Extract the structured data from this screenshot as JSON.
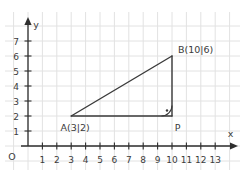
{
  "figure": {
    "canvas": {
      "width": 243,
      "height": 178,
      "background": "#ffffff"
    },
    "colors": {
      "grid": "#e2e2e2",
      "axis": "#2e2e2e",
      "shape": "#3a3a3a",
      "text": "#3b3b3b"
    },
    "origin": {
      "px": 28,
      "py": 146,
      "label": "O"
    },
    "x_axis": {
      "label": "x",
      "unit_px": 14.4,
      "line_start_px": 21,
      "arrow_tip_px": 238,
      "label_pos": {
        "x": 230.5,
        "y": 137
      },
      "tick_labels": [
        "1",
        "2",
        "3",
        "4",
        "5",
        "6",
        "7",
        "8",
        "9",
        "10",
        "11",
        "12",
        "13"
      ],
      "tick_label_baseline": 163
    },
    "y_axis": {
      "label": "y",
      "unit_px": 15,
      "arrow_tip_px": 17,
      "label_pos": {
        "x": 36,
        "y": 28
      },
      "tick_labels": [
        "1",
        "2",
        "3",
        "4",
        "5",
        "6",
        "7"
      ],
      "tick_label_right_x": 19
    },
    "origin_label_pos": {
      "x": 12,
      "y": 160
    },
    "grid_range": {
      "x_min": -1,
      "x_max": 14,
      "y_min": -1,
      "y_max": 8
    },
    "grid_extent": {
      "v_top": 12,
      "v_bottom": 170,
      "h_left": 5,
      "h_right": 240
    },
    "points": [
      {
        "id": "A",
        "x": 3,
        "y": 2,
        "label": "A(3|2)",
        "label_dx": 4,
        "label_dy": 15,
        "anchor": "middle"
      },
      {
        "id": "B",
        "x": 10,
        "y": 6,
        "label": "B(10|6)",
        "label_dx": 6,
        "label_dy": -3,
        "anchor": "start"
      },
      {
        "id": "P",
        "x": 10,
        "y": 2,
        "label": "P",
        "label_dx": 5.5,
        "label_dy": 14.5,
        "anchor": "middle"
      }
    ],
    "segments": [
      {
        "from": "A",
        "to": "B"
      },
      {
        "from": "A",
        "to": "P"
      },
      {
        "from": "B",
        "to": "P"
      }
    ],
    "right_angle": {
      "vertex": "P",
      "arms": [
        "A",
        "B"
      ],
      "radius_px": 10.5,
      "dot_offset": {
        "dx": -5,
        "dy": -5.5
      },
      "dot_radius": 1.2
    }
  }
}
